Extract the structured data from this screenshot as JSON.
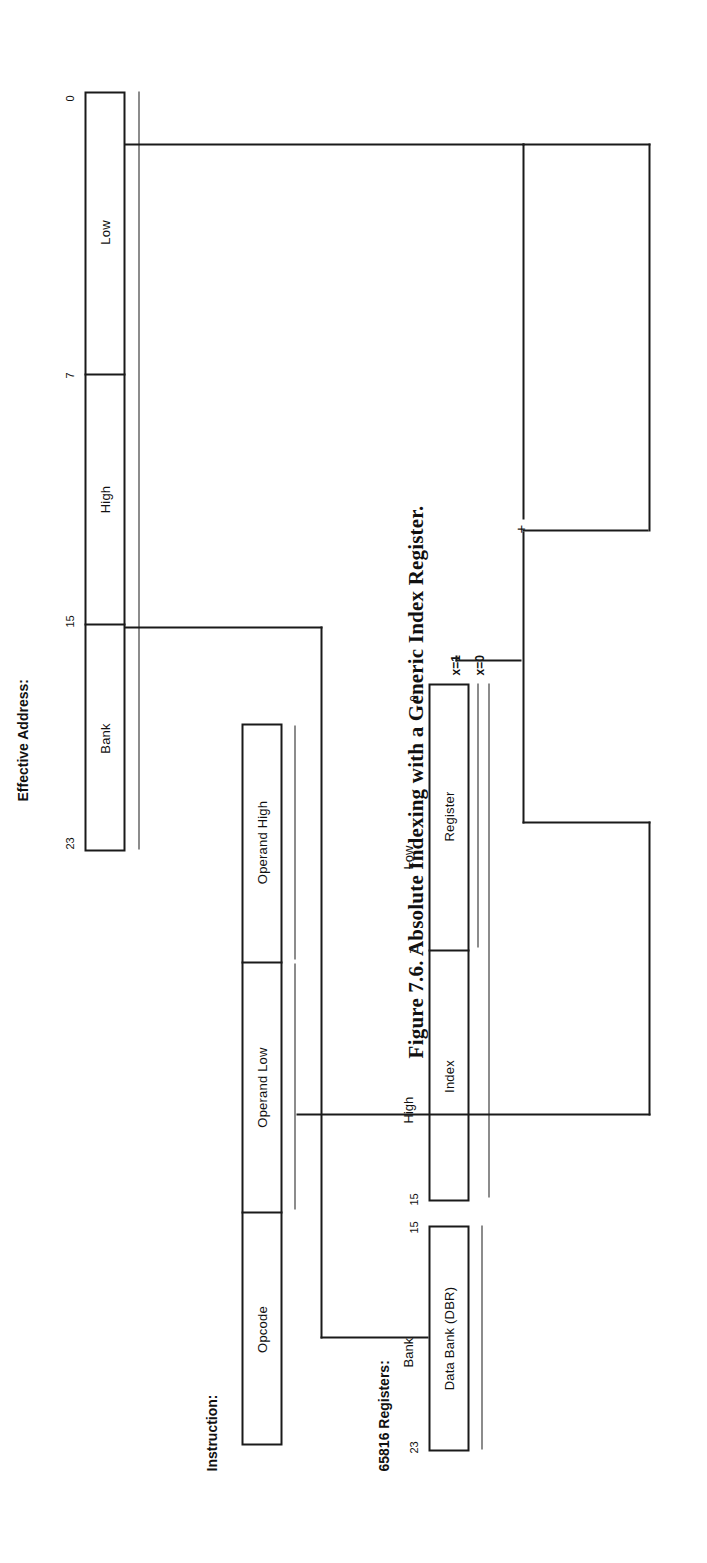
{
  "figure": {
    "caption": "Figure 7.6. Absolute Indexing with a Generic Index Register.",
    "ink_color": "#1a1a1a",
    "background": "#ffffff"
  },
  "effective_address": {
    "heading": "Effective Address:",
    "bit_labels": {
      "msb": "23",
      "b15": "15",
      "b7": "7",
      "lsb": "0"
    },
    "fields": [
      {
        "name": "Bank",
        "bits": "23-16"
      },
      {
        "name": "High",
        "bits": "15-8"
      },
      {
        "name": "Low",
        "bits": "7-0"
      }
    ]
  },
  "instruction": {
    "heading": "Instruction:",
    "fields": [
      {
        "name": "Opcode"
      },
      {
        "name": "Operand Low"
      },
      {
        "name": "Operand High"
      }
    ]
  },
  "registers": {
    "heading": "65816 Registers:",
    "data_bank": {
      "column_label": "Bank",
      "box_label": "Data Bank (DBR)",
      "bit_labels": {
        "msb": "23",
        "lsb": "15"
      }
    },
    "index": {
      "box_labels": [
        "Index",
        "Register"
      ],
      "column_labels": {
        "high": "High",
        "low": "Low"
      },
      "bit_labels": {
        "b15": "15",
        "b7": "7",
        "b0": "0"
      },
      "conditions": [
        {
          "label": "x=1",
          "meaning": "8-bit index"
        },
        {
          "label": "x=0",
          "meaning": "16-bit index"
        }
      ]
    }
  },
  "adder": {
    "symbol": "+",
    "name": "address-adder"
  }
}
